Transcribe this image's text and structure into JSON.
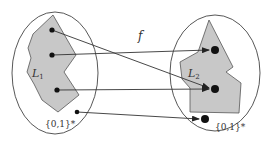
{
  "diagram": {
    "type": "reduction-mapping",
    "function_label": "f",
    "left_set": {
      "language_label": "L",
      "language_subscript": "1",
      "universe_label": "{0,1}*"
    },
    "right_set": {
      "language_label": "L",
      "language_subscript": "2",
      "universe_label": "{0,1}*"
    },
    "mappings": [
      {
        "from": "L1 point 1",
        "to": "L2 point 2"
      },
      {
        "from": "L1 point 2",
        "to": "L2 point 1"
      },
      {
        "from": "L1 point 3",
        "to": "L2 point 2"
      },
      {
        "from": "outside L1",
        "to": "outside L2"
      }
    ],
    "colors": {
      "region_fill": "#c8c8c8",
      "stroke": "#444444",
      "dot": "#111111"
    }
  }
}
